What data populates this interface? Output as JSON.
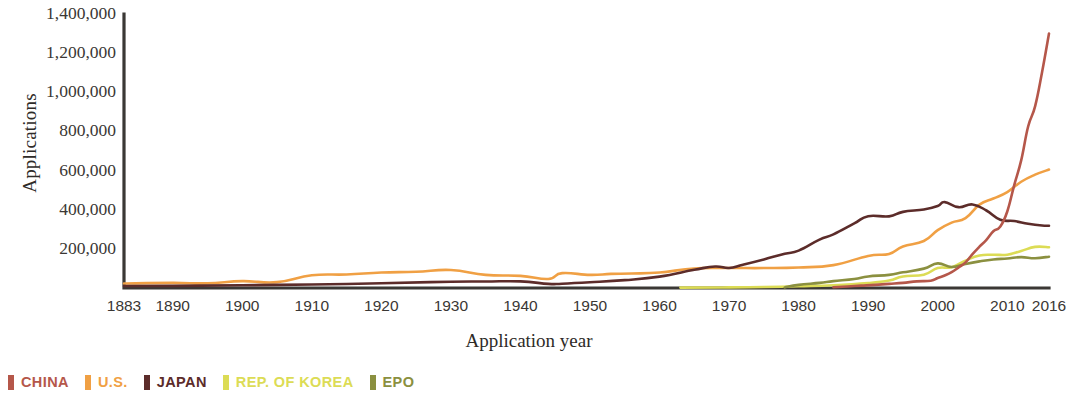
{
  "chart_data": {
    "type": "line",
    "title": "",
    "xlabel": "Application year",
    "ylabel": "Applications",
    "xlim": [
      1883,
      2016
    ],
    "ylim": [
      0,
      1400000
    ],
    "grid": false,
    "legend_position": "bottom-left",
    "ytick_labels": [
      "1,400,000",
      "1,200,000",
      "1,000,000",
      "800,000",
      "600,000",
      "400,000",
      "200,000"
    ],
    "ytick_values": [
      1400000,
      1200000,
      1000000,
      800000,
      600000,
      400000,
      200000
    ],
    "xtick_labels": [
      "1883",
      "1890",
      "1900",
      "1910",
      "1920",
      "1930",
      "1940",
      "1950",
      "1960",
      "1970",
      "1980",
      "1990",
      "2000",
      "2010",
      "2016"
    ],
    "xtick_values": [
      1883,
      1890,
      1900,
      1910,
      1920,
      1930,
      1940,
      1950,
      1960,
      1970,
      1980,
      1990,
      2000,
      2010,
      2016
    ],
    "series": [
      {
        "name": "CHINA",
        "color": "#b5574a",
        "x": [
          1985,
          1987,
          1989,
          1991,
          1993,
          1995,
          1997,
          1999,
          2000,
          2001,
          2002,
          2003,
          2004,
          2005,
          2006,
          2007,
          2008,
          2009,
          2010,
          2011,
          2012,
          2013,
          2014,
          2015,
          2016
        ],
        "values": [
          4000,
          8000,
          12000,
          16000,
          21000,
          26000,
          34000,
          37000,
          51000,
          64000,
          81000,
          105000,
          131000,
          173000,
          211000,
          246000,
          290000,
          314000,
          391000,
          526000,
          652000,
          825000,
          928000,
          1102000,
          1300000
        ]
      },
      {
        "name": "U.S.",
        "color": "#f0a044",
        "x": [
          1883,
          1890,
          1895,
          1900,
          1905,
          1910,
          1915,
          1920,
          1925,
          1930,
          1935,
          1940,
          1944,
          1946,
          1950,
          1953,
          1956,
          1960,
          1965,
          1970,
          1975,
          1980,
          1985,
          1990,
          1993,
          1995,
          1998,
          2000,
          2002,
          2004,
          2006,
          2008,
          2010,
          2012,
          2014,
          2016
        ],
        "values": [
          23000,
          26000,
          24000,
          35000,
          30000,
          65000,
          69000,
          79000,
          83000,
          92000,
          67000,
          62000,
          46000,
          76000,
          67000,
          72000,
          74000,
          79000,
          100000,
          102000,
          102000,
          105000,
          117000,
          164000,
          174000,
          212000,
          240000,
          296000,
          334000,
          357000,
          426000,
          457000,
          490000,
          543000,
          579000,
          605000
        ]
      },
      {
        "name": "JAPAN",
        "color": "#5c2c2a",
        "x": [
          1883,
          1890,
          1900,
          1910,
          1920,
          1930,
          1935,
          1940,
          1944,
          1946,
          1950,
          1955,
          1960,
          1965,
          1968,
          1970,
          1972,
          1975,
          1978,
          1980,
          1983,
          1985,
          1988,
          1990,
          1993,
          1995,
          1998,
          2000,
          2001,
          2003,
          2005,
          2007,
          2009,
          2011,
          2013,
          2015,
          2016
        ],
        "values": [
          10000,
          11000,
          14000,
          18000,
          24000,
          32000,
          33000,
          34000,
          21000,
          22000,
          29000,
          40000,
          58000,
          93000,
          110000,
          102000,
          119000,
          146000,
          175000,
          191000,
          247000,
          274000,
          330000,
          367000,
          366000,
          389000,
          401000,
          419000,
          439000,
          413000,
          427000,
          396000,
          349000,
          342000,
          328000,
          319000,
          318000
        ]
      },
      {
        "name": "REP. OF KOREA",
        "color": "#dcdc55",
        "x": [
          1963,
          1970,
          1975,
          1980,
          1985,
          1990,
          1993,
          1995,
          1998,
          2000,
          2002,
          2004,
          2006,
          2008,
          2010,
          2012,
          2014,
          2016
        ],
        "values": [
          2000,
          3000,
          5000,
          9000,
          14000,
          25000,
          38000,
          59000,
          68000,
          102000,
          106000,
          140000,
          166000,
          170000,
          170000,
          189000,
          210000,
          208000
        ]
      },
      {
        "name": "EPO",
        "color": "#8b9040",
        "x": [
          1978,
          1980,
          1983,
          1985,
          1988,
          1990,
          1993,
          1995,
          1998,
          2000,
          2002,
          2004,
          2006,
          2008,
          2010,
          2012,
          2014,
          2016
        ],
        "values": [
          3000,
          16000,
          26000,
          35000,
          46000,
          59000,
          67000,
          80000,
          99000,
          126000,
          107000,
          123000,
          136000,
          146000,
          151000,
          158000,
          152000,
          160000
        ]
      }
    ]
  },
  "axis": {
    "ylabel": "Applications",
    "xlabel": "Application year"
  },
  "legend": {
    "items": [
      {
        "label": "CHINA",
        "color": "#b5574a"
      },
      {
        "label": "U.S.",
        "color": "#f0a044"
      },
      {
        "label": "JAPAN",
        "color": "#5c2c2a"
      },
      {
        "label": "REP. OF KOREA",
        "color": "#dcdc55"
      },
      {
        "label": "EPO",
        "color": "#8b9040"
      }
    ]
  }
}
